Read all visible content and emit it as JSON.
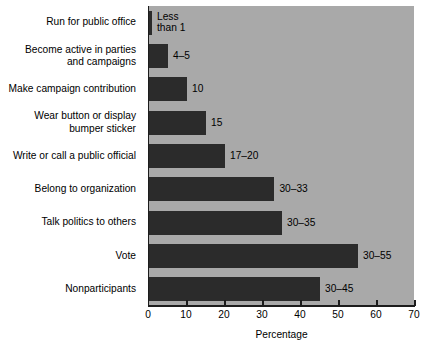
{
  "chart_data": {
    "type": "bar",
    "orientation": "horizontal",
    "title": "",
    "xlabel": "Percentage",
    "ylabel": "",
    "xlim": [
      0,
      70
    ],
    "xticks": [
      0,
      10,
      20,
      30,
      40,
      50,
      60,
      70
    ],
    "grid": false,
    "legend": null,
    "categories": [
      "Run for public office",
      "Become active in parties and campaigns",
      "Make campaign contribution",
      "Wear button or display bumper sticker",
      "Write or call a public official",
      "Belong to organization",
      "Talk politics to others",
      "Vote",
      "Nonparticipants"
    ],
    "category_lines": [
      [
        "Run for public office"
      ],
      [
        "Become active in parties",
        "and campaigns"
      ],
      [
        "Make campaign contribution"
      ],
      [
        "Wear button or display",
        "bumper sticker"
      ],
      [
        "Write or call a public official"
      ],
      [
        "Belong to organization"
      ],
      [
        "Talk politics to others"
      ],
      [
        "Vote"
      ],
      [
        "Nonparticipants"
      ]
    ],
    "values": [
      0.8,
      5,
      10,
      15,
      20,
      33,
      35,
      55,
      45
    ],
    "value_labels": [
      "Less than 1",
      "4–5",
      "10",
      "15",
      "17–20",
      "30–33",
      "30–35",
      "30–55",
      "30–45"
    ],
    "value_label_lines": [
      [
        "Less",
        "than 1"
      ],
      [
        "4–5"
      ],
      [
        "10"
      ],
      [
        "15"
      ],
      [
        "17–20"
      ],
      [
        "30–33"
      ],
      [
        "30–35"
      ],
      [
        "30–55"
      ],
      [
        "30–45"
      ]
    ],
    "ranges": [
      {
        "low": null,
        "high": 1,
        "note": "less than 1"
      },
      {
        "low": 4,
        "high": 5
      },
      {
        "low": 10,
        "high": 10
      },
      {
        "low": 15,
        "high": 15
      },
      {
        "low": 17,
        "high": 20
      },
      {
        "low": 30,
        "high": 33
      },
      {
        "low": 30,
        "high": 35
      },
      {
        "low": 30,
        "high": 55
      },
      {
        "low": 30,
        "high": 45
      }
    ],
    "colors": {
      "bar": "#2b2b2b",
      "plot_background": "#a9a9a9",
      "page_background": "#ffffff",
      "axis": "#1c1c1c",
      "text": "#000000"
    }
  }
}
